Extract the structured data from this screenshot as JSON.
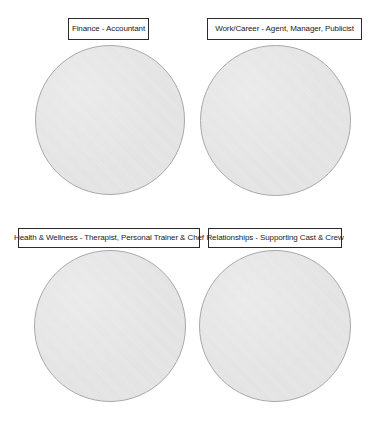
{
  "quadrants": [
    {
      "id": "finance",
      "label": "Finance - Accountant",
      "box": {
        "x": 68,
        "y": 18,
        "w": 81,
        "h": 22
      },
      "circle": {
        "x": 35,
        "y": 45,
        "d": 150
      }
    },
    {
      "id": "work-career",
      "label": "Work/Career - Agent, Manager, Publicist",
      "box": {
        "x": 207,
        "y": 18,
        "w": 155,
        "h": 22
      },
      "circle": {
        "x": 200,
        "y": 45,
        "d": 151
      }
    },
    {
      "id": "health-wellness",
      "label": "Health & Wellness - Therapist, Personal Trainer & Chef",
      "box": {
        "x": 18,
        "y": 228,
        "w": 182,
        "h": 20
      },
      "circle": {
        "x": 34,
        "y": 250,
        "d": 152
      }
    },
    {
      "id": "relationships",
      "label": "Relationships - Supporting Cast & Crew",
      "box": {
        "x": 208,
        "y": 228,
        "w": 134,
        "h": 20
      },
      "circle": {
        "x": 199,
        "y": 250,
        "d": 152
      }
    }
  ],
  "colors": {
    "circle_fill": "#e6e6e6",
    "circle_border": "#a9a9a9",
    "label_border": "#2b2b2b",
    "label_text": "#222222",
    "background": "#ffffff"
  }
}
